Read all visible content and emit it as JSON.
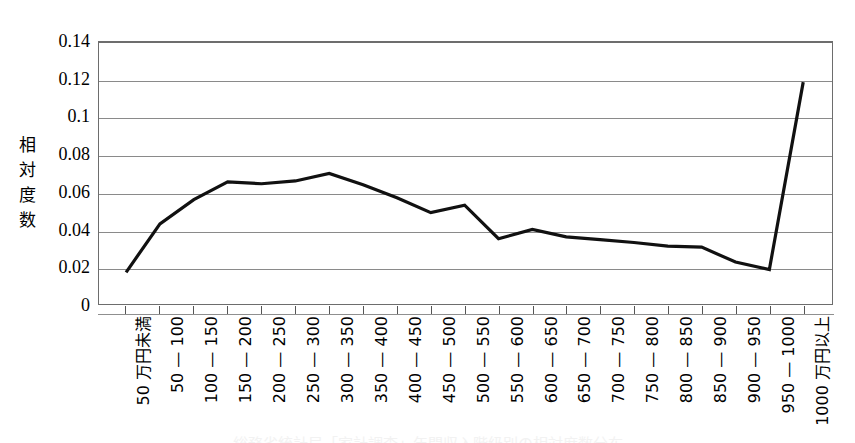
{
  "chart_data": {
    "type": "line",
    "title": "",
    "subtitle": "",
    "xlabel": "",
    "ylabel": "相対度数",
    "ylabel_chars": "相\n対\n度\n数",
    "ylim": [
      0,
      0.14
    ],
    "ytick_labels": [
      "0.14",
      "0.12",
      "0.1",
      "0.08",
      "0.06",
      "0.04",
      "0.02",
      "0"
    ],
    "ytick_values": [
      0.14,
      0.12,
      0.1,
      0.08,
      0.06,
      0.04,
      0.02,
      0
    ],
    "grid": true,
    "grid_axis": "y",
    "legend": "none",
    "line_color": "#111111",
    "line_width": 3.2,
    "categories": [
      "50 万円未満",
      "50 — 100",
      "100 — 150",
      "150 — 200",
      "200 — 250",
      "250 — 300",
      "300 — 350",
      "350 — 400",
      "400 — 450",
      "450 — 500",
      "500 — 550",
      "550 — 600",
      "600 — 650",
      "650 — 700",
      "700 — 750",
      "750 — 800",
      "800 — 850",
      "850 — 900",
      "900 — 950",
      "950 — 1000",
      "1000 万円以上"
    ],
    "values": [
      0.017,
      0.043,
      0.056,
      0.0655,
      0.0645,
      0.066,
      0.07,
      0.064,
      0.057,
      0.049,
      0.053,
      0.035,
      0.04,
      0.036,
      0.0345,
      0.033,
      0.031,
      0.0305,
      0.0225,
      0.0185,
      0.119
    ]
  },
  "bottom_caption": "総務省統計局「家計調査」年間収入階級別の相対度数分布"
}
